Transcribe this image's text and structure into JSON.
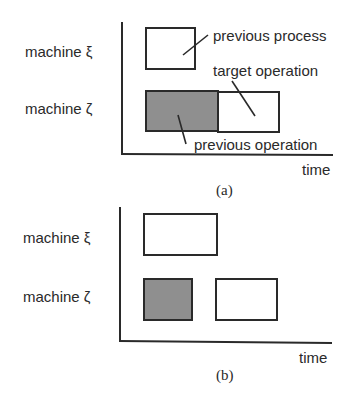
{
  "figure": {
    "panel_a": {
      "caption": "(a)",
      "row_labels": [
        "machine ξ",
        "machine ζ"
      ],
      "x_axis_label": "time",
      "annotations": {
        "previous_process": "previous process",
        "target_operation": "target operation",
        "previous_operation": "previous operation"
      },
      "blocks": [
        {
          "row": "machine ξ",
          "role": "previous process",
          "fill": "#ffffff"
        },
        {
          "row": "machine ζ",
          "role": "previous operation",
          "fill": "#8f8f8f"
        },
        {
          "row": "machine ζ",
          "role": "target operation",
          "fill": "#ffffff"
        }
      ]
    },
    "panel_b": {
      "caption": "(b)",
      "row_labels": [
        "machine ξ",
        "machine ζ"
      ],
      "x_axis_label": "time",
      "blocks": [
        {
          "row": "machine ξ",
          "fill": "#ffffff"
        },
        {
          "row": "machine ζ",
          "fill": "#8f8f8f"
        },
        {
          "row": "machine ζ",
          "fill": "#ffffff"
        }
      ]
    }
  }
}
